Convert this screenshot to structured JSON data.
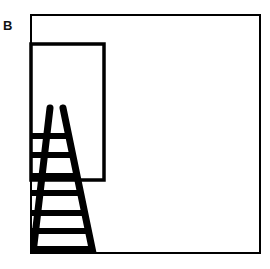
{
  "panel": {
    "label": "B"
  },
  "colors": {
    "background": "#ffffff",
    "stroke": "#000000"
  },
  "scene": {
    "outer_frame": {
      "x": 31,
      "y": 15,
      "width": 229,
      "height": 238,
      "stroke_width": 2
    },
    "inner_rectangle": {
      "x": 31,
      "y": 44,
      "width": 73,
      "height": 136,
      "stroke_width": 3.5
    },
    "ladder": {
      "left_rail": {
        "top": [
          50,
          108
        ],
        "bottom": [
          33,
          253
        ],
        "width": 7
      },
      "right_rail": {
        "top": [
          63,
          108
        ],
        "bottom": [
          93,
          253
        ],
        "width": 7
      },
      "rungs_y": [
        136,
        155,
        176,
        193,
        213,
        231,
        249
      ],
      "rung_height": 6
    }
  }
}
